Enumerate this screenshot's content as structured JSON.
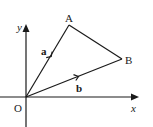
{
  "diagram": {
    "type": "vector-diagram",
    "axes": {
      "x_label": "x",
      "y_label": "y"
    },
    "points": {
      "origin": {
        "label": "O",
        "x": 26,
        "y": 97
      },
      "A": {
        "label": "A",
        "x": 69,
        "y": 25
      },
      "B": {
        "label": "B",
        "x": 122,
        "y": 59
      }
    },
    "vectors": [
      {
        "name": "a",
        "from": "O",
        "to": "A",
        "label": "a"
      },
      {
        "name": "b",
        "from": "O",
        "to": "B",
        "label": "b"
      }
    ],
    "segments": [
      {
        "from": "A",
        "to": "B"
      }
    ],
    "colors": {
      "stroke": "#1a1a1a",
      "background": "#ffffff"
    }
  }
}
